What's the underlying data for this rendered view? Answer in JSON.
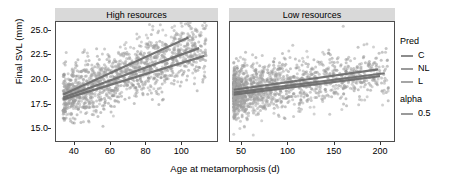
{
  "chart_data": {
    "type": "scatter",
    "title": "",
    "xlabel": "Age at metamorphosis (d)",
    "ylabel": "Final SVL (mm)",
    "xticks_high": [
      40,
      60,
      80,
      100
    ],
    "xticks_low": [
      50,
      100,
      150,
      200
    ],
    "yticks": [
      15.0,
      17.5,
      20.0,
      22.5,
      25.0
    ],
    "ylim": [
      13.6,
      25.9
    ],
    "grid": false,
    "legend_position": "right",
    "facets": [
      {
        "key": "high",
        "label": "High resources",
        "xlim": [
          30,
          120
        ],
        "series": [
          {
            "name": "C",
            "color": "#8c8c8c",
            "fit": {
              "x0": 34,
              "y0": 17.9,
              "x1": 113,
              "y1": 22.4
            },
            "n_points": 470
          },
          {
            "name": "NL",
            "color": "#9a9a9a",
            "fit": {
              "x0": 34,
              "y0": 18.4,
              "x1": 104,
              "y1": 24.3
            },
            "n_points": 430
          },
          {
            "name": "L",
            "color": "#a6a6a6",
            "fit": {
              "x0": 34,
              "y0": 18.1,
              "x1": 110,
              "y1": 23.2
            },
            "n_points": 420
          }
        ]
      },
      {
        "key": "low",
        "label": "Low resources",
        "xlim": [
          38,
          215
        ],
        "series": [
          {
            "name": "C",
            "color": "#8c8c8c",
            "fit": {
              "x0": 42,
              "y0": 18.6,
              "x1": 205,
              "y1": 20.6
            },
            "n_points": 520
          },
          {
            "name": "NL",
            "color": "#9a9a9a",
            "fit": {
              "x0": 42,
              "y0": 18.9,
              "x1": 198,
              "y1": 21.0
            },
            "n_points": 430
          },
          {
            "name": "L",
            "color": "#a6a6a6",
            "fit": {
              "x0": 42,
              "y0": 18.4,
              "x1": 200,
              "y1": 20.3
            },
            "n_points": 400
          }
        ]
      }
    ]
  },
  "legend": {
    "pred": {
      "title": "Pred",
      "items": [
        {
          "label": "C",
          "color": "#8c8c8c"
        },
        {
          "label": "NL",
          "color": "#9a9a9a"
        },
        {
          "label": "L",
          "color": "#a6a6a6"
        }
      ]
    },
    "alpha": {
      "title": "alpha",
      "items": [
        {
          "label": "0.5",
          "color": "#9a9a9a"
        }
      ]
    }
  },
  "style": {
    "panel_border": "#4d4d4d",
    "strip_background": "#d9d9d9",
    "point_color": "#8c8c8c",
    "text_color": "#000000",
    "background": "#ffffff"
  }
}
